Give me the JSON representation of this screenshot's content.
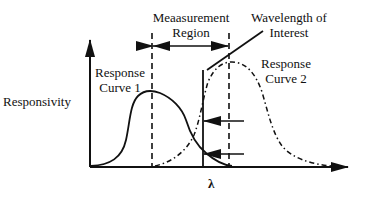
{
  "diagram": {
    "title": "",
    "labels": {
      "y_axis": "Responsivity",
      "x_axis": "λ",
      "measurement_region_line1": "Meaasurement",
      "measurement_region_line2": "Region",
      "wavelength_line1": "Wavelength of",
      "wavelength_line2": "Interest",
      "curve1_line1": "Response",
      "curve1_line2": "Curve 1",
      "curve2_line1": "Response",
      "curve2_line2": "Curve 2"
    },
    "elements": [
      {
        "id": "y-axis",
        "type": "arrow",
        "style": "solid"
      },
      {
        "id": "x-axis",
        "type": "arrow",
        "style": "solid"
      },
      {
        "id": "region-left-bound",
        "type": "line",
        "style": "dashed"
      },
      {
        "id": "region-right-bound",
        "type": "line",
        "style": "dashed"
      },
      {
        "id": "region-double-arrow",
        "type": "double-arrow",
        "style": "solid"
      },
      {
        "id": "wavelength-marker",
        "type": "line",
        "style": "solid"
      },
      {
        "id": "wavelength-leader",
        "type": "line",
        "style": "solid"
      },
      {
        "id": "response-curve-1",
        "type": "curve",
        "style": "solid"
      },
      {
        "id": "response-curve-2",
        "type": "curve",
        "style": "dash-dot"
      },
      {
        "id": "intersection-arrow-upper",
        "type": "arrow",
        "direction": "left"
      },
      {
        "id": "intersection-arrow-lower",
        "type": "arrow",
        "direction": "left"
      }
    ],
    "colors": {
      "stroke": "#111111",
      "background": "#ffffff"
    }
  }
}
